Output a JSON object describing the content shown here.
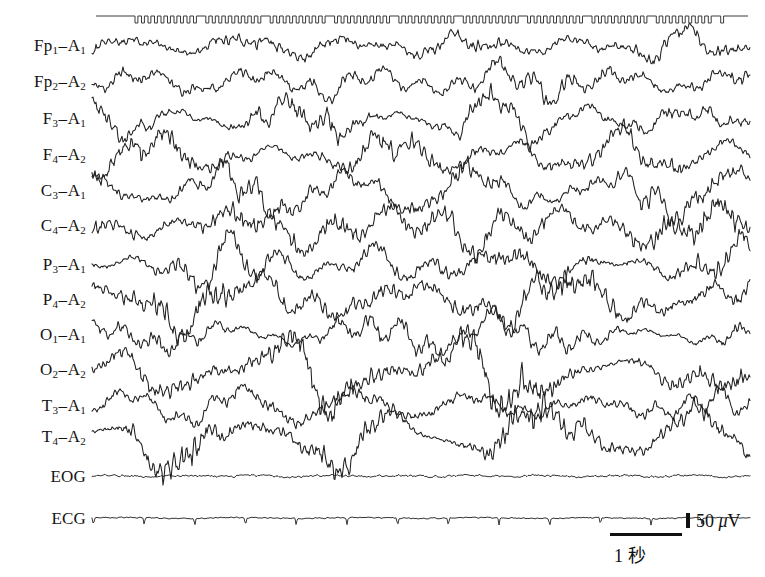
{
  "recording": {
    "type": "polysomnography-eeg",
    "background_color": "#ffffff",
    "trace_color": "#1a1a1a",
    "montage": "referential (ear reference A1/A2)"
  },
  "channels": [
    {
      "name": "Fp1-A1",
      "site": "Fp",
      "index": "1",
      "ref": "A",
      "ref_index": "1",
      "baseline_y": 46,
      "kind": "eeg"
    },
    {
      "name": "Fp2-A2",
      "site": "Fp",
      "index": "2",
      "ref": "A",
      "ref_index": "2",
      "baseline_y": 82,
      "kind": "eeg"
    },
    {
      "name": "F3-A1",
      "site": "F",
      "index": "3",
      "ref": "A",
      "ref_index": "1",
      "baseline_y": 119,
      "kind": "eeg"
    },
    {
      "name": "F4-A2",
      "site": "F",
      "index": "4",
      "ref": "A",
      "ref_index": "2",
      "baseline_y": 155,
      "kind": "eeg"
    },
    {
      "name": "C3-A1",
      "site": "C",
      "index": "3",
      "ref": "A",
      "ref_index": "1",
      "baseline_y": 191,
      "kind": "eeg"
    },
    {
      "name": "C4-A2",
      "site": "C",
      "index": "4",
      "ref": "A",
      "ref_index": "2",
      "baseline_y": 226,
      "kind": "eeg"
    },
    {
      "name": "P3-A1",
      "site": "P",
      "index": "3",
      "ref": "A",
      "ref_index": "1",
      "baseline_y": 265,
      "kind": "eeg"
    },
    {
      "name": "P4-A2",
      "site": "P",
      "index": "4",
      "ref": "A",
      "ref_index": "2",
      "baseline_y": 300,
      "kind": "eeg"
    },
    {
      "name": "O1-A1",
      "site": "O",
      "index": "1",
      "ref": "A",
      "ref_index": "1",
      "baseline_y": 335,
      "kind": "eeg"
    },
    {
      "name": "O2-A2",
      "site": "O",
      "index": "2",
      "ref": "A",
      "ref_index": "2",
      "baseline_y": 370,
      "kind": "eeg"
    },
    {
      "name": "T3-A1",
      "site": "T",
      "index": "3",
      "ref": "A",
      "ref_index": "1",
      "baseline_y": 406,
      "kind": "eeg"
    },
    {
      "name": "T4-A2",
      "site": "T",
      "index": "4",
      "ref": "A",
      "ref_index": "2",
      "baseline_y": 437,
      "kind": "eeg"
    },
    {
      "name": "EOG",
      "site": "EOG",
      "index": "",
      "ref": "",
      "ref_index": "",
      "baseline_y": 476,
      "kind": "eog"
    },
    {
      "name": "ECG",
      "site": "ECG",
      "index": "",
      "ref": "",
      "ref_index": "",
      "baseline_y": 518,
      "kind": "ecg"
    }
  ],
  "timebar": {
    "y": 16,
    "x_start": 96,
    "x_end": 748,
    "tick_spacing_px": 6.5,
    "tick_height_px": 7,
    "second_marker_every_n_ticks": 10,
    "lead_in_x": 96,
    "comb_start_x": 135,
    "comb_end_x": 722
  },
  "trace_extent": {
    "x_start": 92,
    "x_end": 750
  },
  "calibration": {
    "amplitude_label": "50",
    "amplitude_unit_mu": "μ",
    "amplitude_unit_v": "V",
    "amplitude_full": "50 μV",
    "time_label": "1 秒",
    "time_seconds": 1,
    "vertical_tick_height_px": 15,
    "horizontal_bar_width_px": 72
  },
  "chart_data": {
    "type": "line",
    "title": "",
    "xlabel": "1 秒",
    "ylabel": "50 μV",
    "grid": false,
    "legend": "none",
    "sampling_note": "polygraph paper trace, high-amplitude slow waves",
    "series": [
      {
        "name": "Fp1-A1",
        "amplitude_px": 17,
        "base_freq_hz": 1.3,
        "seed": 11
      },
      {
        "name": "Fp2-A2",
        "amplitude_px": 19,
        "base_freq_hz": 1.2,
        "seed": 23
      },
      {
        "name": "F3-A1",
        "amplitude_px": 21,
        "base_freq_hz": 1.4,
        "seed": 37
      },
      {
        "name": "F4-A2",
        "amplitude_px": 22,
        "base_freq_hz": 1.25,
        "seed": 41
      },
      {
        "name": "C3-A1",
        "amplitude_px": 24,
        "base_freq_hz": 1.1,
        "seed": 59
      },
      {
        "name": "C4-A2",
        "amplitude_px": 30,
        "base_freq_hz": 0.85,
        "seed": 67
      },
      {
        "name": "P3-A1",
        "amplitude_px": 23,
        "base_freq_hz": 1.15,
        "seed": 73
      },
      {
        "name": "P4-A2",
        "amplitude_px": 31,
        "base_freq_hz": 0.9,
        "seed": 89
      },
      {
        "name": "O1-A1",
        "amplitude_px": 20,
        "base_freq_hz": 1.05,
        "seed": 97
      },
      {
        "name": "O2-A2",
        "amplitude_px": 33,
        "base_freq_hz": 0.8,
        "seed": 103
      },
      {
        "name": "T3-A1",
        "amplitude_px": 18,
        "base_freq_hz": 1.2,
        "seed": 113
      },
      {
        "name": "T4-A2",
        "amplitude_px": 29,
        "base_freq_hz": 0.95,
        "seed": 127
      },
      {
        "name": "EOG",
        "amplitude_px": 2,
        "base_freq_hz": 1.5,
        "seed": 131
      },
      {
        "name": "ECG",
        "amplitude_px": 2,
        "base_freq_hz": 1.2,
        "seed": 139
      }
    ]
  }
}
